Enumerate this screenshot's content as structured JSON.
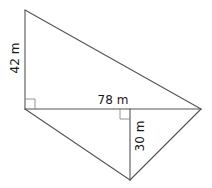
{
  "diagram": {
    "type": "geometry-figure",
    "colors": {
      "line": "#555555",
      "text": "#1a1a1a",
      "background": "#ffffff"
    },
    "points": {
      "top_left": {
        "x": 25,
        "y": 10
      },
      "left": {
        "x": 25,
        "y": 109
      },
      "right": {
        "x": 201,
        "y": 109
      },
      "foot": {
        "x": 130,
        "y": 109
      },
      "bottom": {
        "x": 130,
        "y": 180
      }
    },
    "labels": {
      "height_upper": "42 m",
      "base": "78 m",
      "height_lower": "30 m"
    },
    "right_angle_markers": [
      {
        "at": "left",
        "size": 10
      },
      {
        "at": "foot",
        "size": 10
      }
    ]
  }
}
